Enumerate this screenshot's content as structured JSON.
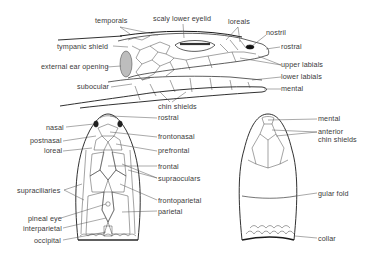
{
  "figure": {
    "views": {
      "lateral": {
        "labels": [
          {
            "id": "temporals",
            "text": "temporals",
            "x": 95,
            "y": 21,
            "align": "left"
          },
          {
            "id": "scaly-lower-eyelid",
            "text": "scaly lower eyelid",
            "x": 153,
            "y": 18,
            "align": "left"
          },
          {
            "id": "loreals",
            "text": "loreals",
            "x": 228,
            "y": 21,
            "align": "left"
          },
          {
            "id": "nostril",
            "text": "nostril",
            "x": 266,
            "y": 32,
            "align": "left"
          },
          {
            "id": "rostral-lateral",
            "text": "rostral",
            "x": 280,
            "y": 44,
            "align": "left"
          },
          {
            "id": "tympanic-shield",
            "text": "tympanic shield",
            "x": 57,
            "y": 43,
            "align": "left"
          },
          {
            "id": "external-ear-opening",
            "text": "external ear opening",
            "x": 41,
            "y": 64,
            "align": "left"
          },
          {
            "id": "upper-labials",
            "text": "upper labials",
            "x": 281,
            "y": 62,
            "align": "left"
          },
          {
            "id": "lower-labials",
            "text": "lower labials",
            "x": 281,
            "y": 74,
            "align": "left"
          },
          {
            "id": "subocular",
            "text": "subocular",
            "x": 76,
            "y": 84,
            "align": "left"
          },
          {
            "id": "mental-lateral",
            "text": "mental",
            "x": 281,
            "y": 86,
            "align": "left"
          },
          {
            "id": "chin-shields",
            "text": "chin shields",
            "x": 158,
            "y": 103,
            "align": "left"
          }
        ]
      },
      "dorsal": {
        "labels": [
          {
            "id": "rostral-dorsal",
            "text": "rostral",
            "x": 158,
            "y": 115,
            "align": "left"
          },
          {
            "id": "nasal",
            "text": "nasal",
            "x": 46,
            "y": 124,
            "align": "left"
          },
          {
            "id": "frontonasal",
            "text": "frontonasal",
            "x": 158,
            "y": 134,
            "align": "left"
          },
          {
            "id": "postnasal",
            "text": "postnasal",
            "x": 30,
            "y": 138,
            "align": "left"
          },
          {
            "id": "prefrontal",
            "text": "prefrontal",
            "x": 158,
            "y": 148,
            "align": "left"
          },
          {
            "id": "loreal",
            "text": "loreal",
            "x": 44,
            "y": 148,
            "align": "left"
          },
          {
            "id": "frontal",
            "text": "frontal",
            "x": 158,
            "y": 163,
            "align": "left"
          },
          {
            "id": "supraoculars",
            "text": "supraoculars",
            "x": 158,
            "y": 175,
            "align": "left"
          },
          {
            "id": "supraciliaries",
            "text": "supraciliaries",
            "x": 17,
            "y": 187,
            "align": "left"
          },
          {
            "id": "frontoparietal",
            "text": "frontoparietal",
            "x": 158,
            "y": 197,
            "align": "left"
          },
          {
            "id": "parietal",
            "text": "parietal",
            "x": 158,
            "y": 208,
            "align": "left"
          },
          {
            "id": "pineal-eye",
            "text": "pineal eye",
            "x": 28,
            "y": 215,
            "align": "left"
          },
          {
            "id": "interparietal",
            "text": "interparietal",
            "x": 23,
            "y": 225,
            "align": "left"
          },
          {
            "id": "occipital",
            "text": "occipital",
            "x": 34,
            "y": 237,
            "align": "left"
          }
        ]
      },
      "ventral": {
        "labels": [
          {
            "id": "mental-ventral",
            "text": "mental",
            "x": 318,
            "y": 116,
            "align": "left"
          },
          {
            "id": "anterior-chin-shields-1",
            "text": "anterior",
            "x": 318,
            "y": 129,
            "align": "left"
          },
          {
            "id": "anterior-chin-shields-2",
            "text": "chin shields",
            "x": 318,
            "y": 137,
            "align": "left"
          },
          {
            "id": "gular-fold",
            "text": "gular fold",
            "x": 318,
            "y": 190,
            "align": "left"
          },
          {
            "id": "collar",
            "text": "collar",
            "x": 318,
            "y": 235,
            "align": "left"
          }
        ]
      }
    },
    "colors": {
      "line": "#1a1a1a",
      "text": "#3a3a3a",
      "background": "#ffffff",
      "stipple": "#555555"
    }
  }
}
